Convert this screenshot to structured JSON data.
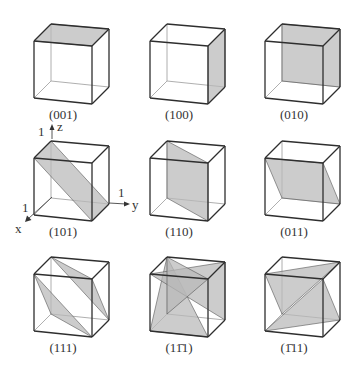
{
  "colors": {
    "plane_fill": "#b8b8b8",
    "edge": "#2e2e2e",
    "hidden_edge": "#9a9a9a"
  },
  "axes": {
    "x_label": "x",
    "y_label": "y",
    "z_label": "z",
    "x_tick": "1",
    "y_tick": "1",
    "z_tick": "1"
  },
  "cubes": [
    {
      "label": "(001)",
      "planes": [
        [
          "tfl",
          "tfr",
          "tbr",
          "tbl"
        ]
      ]
    },
    {
      "label": "(100)",
      "planes": [
        [
          "tfr",
          "tbr",
          "bbr",
          "bfr"
        ]
      ]
    },
    {
      "label": "(010)",
      "planes": [
        [
          "tbl",
          "tbr",
          "bbr",
          "bbl"
        ]
      ]
    },
    {
      "label": "(101)",
      "planes": [
        [
          "tbl",
          "tfl",
          "bfr",
          "bbr"
        ]
      ]
    },
    {
      "label": "(110)",
      "planes": [
        [
          "tbl",
          "tfr",
          "bfr",
          "bbl"
        ]
      ]
    },
    {
      "label": "(011)",
      "planes": [
        [
          "tfl",
          "tfr",
          "bbr",
          "bbl"
        ]
      ]
    },
    {
      "label": "(111)",
      "planes": [
        [
          "tbl",
          "tfr",
          "bbr"
        ],
        [
          "tfl",
          "bfr",
          "bbl"
        ]
      ]
    },
    {
      "label": "(11̄1)",
      "planes": [
        [
          "tbl",
          "bfl",
          "bfr"
        ],
        [
          "tfl",
          "tbr",
          "bbr"
        ],
        [
          "tbl",
          "tfr",
          "bbl"
        ]
      ]
    },
    {
      "label": "(1̄11)",
      "planes": [
        [
          "tfl",
          "tbr",
          "bbl"
        ],
        [
          "tfr",
          "bfl",
          "bbr"
        ]
      ]
    }
  ]
}
